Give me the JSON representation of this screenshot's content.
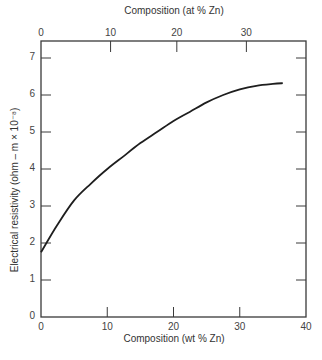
{
  "chart_data": {
    "type": "line",
    "title": "",
    "xlabel": "Composition (wt % Zn)",
    "x2label": "Composition (at % Zn)",
    "ylabel": "Electrical resistivity (ohm – m × 10⁻⁸)",
    "xlim": [
      0,
      40
    ],
    "ylim": [
      0,
      7.4
    ],
    "x_ticks": [
      0,
      10,
      20,
      30,
      40
    ],
    "x2_ticks": [
      0,
      10,
      20,
      30
    ],
    "y_ticks": [
      0,
      1,
      2,
      3,
      4,
      5,
      6,
      7
    ],
    "grid": false,
    "legend": null,
    "series": [
      {
        "name": "Resistivity vs composition (Cu–Zn)",
        "x": [
          0,
          2.5,
          5,
          7.5,
          10,
          12.5,
          15,
          17.5,
          20,
          22.5,
          25,
          27.5,
          30,
          32.5,
          35,
          36.5
        ],
        "y": [
          1.75,
          2.5,
          3.15,
          3.6,
          4.0,
          4.35,
          4.7,
          5.0,
          5.3,
          5.55,
          5.8,
          6.0,
          6.15,
          6.25,
          6.3,
          6.32
        ]
      }
    ],
    "x2_tick_positions_wt": [
      0,
      10.5,
      20.5,
      31
    ]
  },
  "labels": {
    "top_title": "Composition (at % Zn)",
    "bottom_title": "Composition (wt % Zn)",
    "y_title": "Electrical resistivity (ohm – m × 10⁻⁸)"
  },
  "colors": {
    "axis": "#3a3a3a",
    "curve": "#1e1e1e",
    "text": "#444444"
  }
}
